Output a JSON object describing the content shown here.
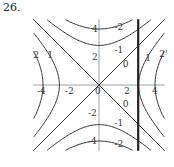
{
  "problem_number": "26.",
  "chart_data": {
    "type": "contour",
    "title": "",
    "function_description": "saddle: level curves of (x^2 - y^2)/8",
    "xlim": [
      -4.7,
      4.7
    ],
    "ylim": [
      -4.7,
      4.7
    ],
    "x_ticks": [
      {
        "value": -4,
        "label": "-4"
      },
      {
        "value": -2,
        "label": "-2"
      },
      {
        "value": 0,
        "label": "0"
      },
      {
        "value": 2,
        "label": "2"
      },
      {
        "value": 4,
        "label": "4"
      }
    ],
    "y_ticks": [
      {
        "value": 4,
        "label": "4"
      },
      {
        "value": 2,
        "label": "2"
      },
      {
        "value": -2,
        "label": "-2"
      },
      {
        "value": -4,
        "label": "-4"
      }
    ],
    "levels": [
      -2,
      -1,
      0,
      1,
      2
    ],
    "contour_labels": [
      {
        "text": "2",
        "x": -4.7,
        "y": 1.9
      },
      {
        "text": "1",
        "x": -3.7,
        "y": 1.9
      },
      {
        "text": "-2",
        "x": 1.1,
        "y": 3.9
      },
      {
        "text": "-1",
        "x": 1.1,
        "y": 2.3
      },
      {
        "text": "0",
        "x": 1.7,
        "y": 1.3
      },
      {
        "text": "1",
        "x": 3.3,
        "y": 1.7
      },
      {
        "text": "2'",
        "x": 4.3,
        "y": 2.0
      },
      {
        "text": "0",
        "x": 1.7,
        "y": -1.6
      },
      {
        "text": "-1",
        "x": 1.1,
        "y": -2.9
      },
      {
        "text": "-2",
        "x": 1.1,
        "y": -4.4
      }
    ],
    "boundary_line": {
      "x": 2.8,
      "y_range": [
        -4.7,
        4.7
      ]
    }
  }
}
